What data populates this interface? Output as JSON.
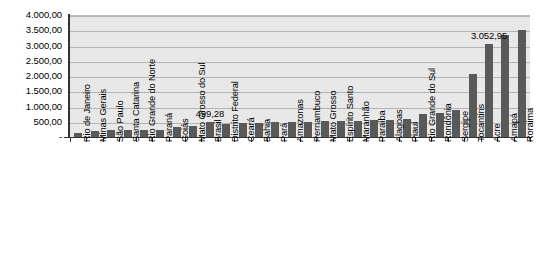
{
  "chart_data": {
    "type": "bar",
    "title": "",
    "subtitle": "",
    "xlabel": "",
    "ylabel": "",
    "ylim": [
      0,
      4000
    ],
    "grid": true,
    "legend": null,
    "y_tick_labels": [
      "4.000,00",
      "3.500,00",
      "3.000,00",
      "2.500,00",
      "2.000,00",
      "1.500,00",
      "1.000,00",
      "500,00",
      "-"
    ],
    "y_tick_values": [
      4000,
      3500,
      3000,
      2500,
      2000,
      1500,
      1000,
      500,
      0
    ],
    "bar_color": "#595959",
    "plot_background": "#e8e8e8",
    "gridline_color": "#b4b4b4",
    "axis_color": "#333333",
    "categories": [
      "Rio de Janeiro",
      "Minas Gerais",
      "São Paulo",
      "Santa Catarina",
      "Rio Grande do Norte",
      "Paraná",
      "Goiás",
      "Mato Grosso do Sul",
      "Brasil",
      "Distrito Federal",
      "Ceará",
      "Bahia",
      "Pará",
      "Amazonas",
      "Pernambuco",
      "Mato Grosso",
      "Espírito Santo",
      "Maranhão",
      "Paraíba",
      "Alagoas",
      "Piauí",
      "Rio Grande do Sul",
      "Rondônia",
      "Sergipe",
      "Tocantins",
      "Acre",
      "Amapá",
      "Roraima"
    ],
    "values": [
      140,
      210,
      215,
      220,
      230,
      240,
      330,
      350,
      499.28,
      430,
      450,
      470,
      480,
      490,
      500,
      510,
      520,
      530,
      545,
      560,
      575,
      740,
      790,
      900,
      2060,
      3052.95,
      3330,
      3500
    ],
    "annotations": [
      {
        "label": "499,28",
        "category": "Brasil",
        "value": 499.28
      },
      {
        "label": "3.052,95",
        "category": "Acre",
        "value": 3052.95
      }
    ]
  }
}
